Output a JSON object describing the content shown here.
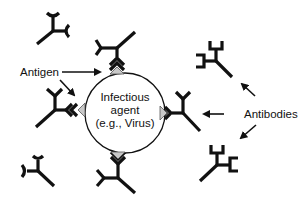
{
  "diagram": {
    "center": {
      "line1": "Infectious",
      "line2": "agent",
      "line3": "(e.g., Virus)"
    },
    "labels": {
      "antigen": "Antigen",
      "antibodies": "Antibodies"
    },
    "colors": {
      "stroke": "#111111",
      "antigen_fill": "#c8c8c8",
      "background": "#ffffff"
    }
  }
}
